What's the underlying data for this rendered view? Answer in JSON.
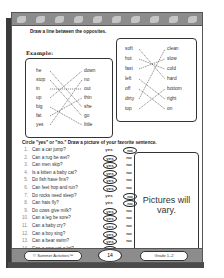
{
  "header": {
    "decoration": "leaf-border"
  },
  "section1": {
    "instruction": "Draw a line between the opposites.",
    "example_label": "Example:",
    "left_box": {
      "left_words": [
        "he",
        "stop",
        "in",
        "up",
        "big",
        "fat",
        "yes"
      ],
      "right_words": [
        "down",
        "no",
        "out",
        "thin",
        "she",
        "go",
        "little"
      ],
      "matches": [
        [
          0,
          4
        ],
        [
          1,
          5
        ],
        [
          2,
          2
        ],
        [
          3,
          0
        ],
        [
          4,
          6
        ],
        [
          5,
          3
        ],
        [
          6,
          1
        ]
      ]
    },
    "right_box": {
      "left_words": [
        "soft",
        "hot",
        "fast",
        "left",
        "off",
        "dirty",
        "top"
      ],
      "right_words": [
        "clean",
        "slow",
        "cold",
        "hard",
        "bottom",
        "right",
        "on"
      ],
      "matches": [
        [
          0,
          3
        ],
        [
          1,
          2
        ],
        [
          2,
          1
        ],
        [
          3,
          5
        ],
        [
          4,
          6
        ],
        [
          5,
          0
        ],
        [
          6,
          4
        ]
      ]
    }
  },
  "section2": {
    "instruction": "Circle \"yes\" or \"no.\" Draw a picture of your favorite sentence.",
    "yes_label": "yes",
    "no_label": "no",
    "questions": [
      {
        "num": "1.",
        "text": "Can a car jump?",
        "answer": "no"
      },
      {
        "num": "2.",
        "text": "Can a rug be wet?",
        "answer": "yes"
      },
      {
        "num": "3.",
        "text": "Can men skip?",
        "answer": "yes"
      },
      {
        "num": "4.",
        "text": "Is a kitten a baby cat?",
        "answer": "yes"
      },
      {
        "num": "5.",
        "text": "Do fish have fins?",
        "answer": "yes"
      },
      {
        "num": "6.",
        "text": "Can feet hop and run?",
        "answer": "yes"
      },
      {
        "num": "7.",
        "text": "Do rocks need sleep?",
        "answer": "no"
      },
      {
        "num": "8.",
        "text": "Can hats fly?",
        "answer": "no"
      },
      {
        "num": "9.",
        "text": "Do cows give milk?",
        "answer": "yes"
      },
      {
        "num": "10.",
        "text": "Can a leg be sore?",
        "answer": "yes"
      },
      {
        "num": "11.",
        "text": "Can a baby cry?",
        "answer": "yes"
      },
      {
        "num": "12.",
        "text": "Can a boy sing?",
        "answer": "yes"
      },
      {
        "num": "13.",
        "text": "Can a bear swim?",
        "answer": "yes"
      },
      {
        "num": "14.",
        "text": "Can a cow eat a lot?",
        "answer": "yes"
      }
    ],
    "picture_box_text": "Pictures will vary."
  },
  "footer": {
    "left": "© Summer Activities™",
    "page_number": "14",
    "right": "Grade 1–2"
  }
}
